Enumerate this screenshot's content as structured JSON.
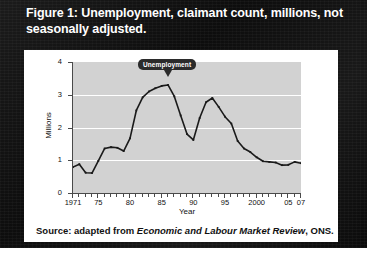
{
  "figure": {
    "title": "Figure 1: Unemployment, claimant count, millions, not seasonally adjusted.",
    "source_prefix": "Source: adapted from ",
    "source_italic": "Economic and Labour Market Review",
    "source_suffix": ", ONS."
  },
  "chart_data": {
    "type": "line",
    "title": "",
    "xlabel": "Year",
    "ylabel": "Millions",
    "annotation": "Unemployment",
    "xlim": [
      1971,
      2007
    ],
    "ylim": [
      0,
      4
    ],
    "yticks": [
      0,
      1,
      2,
      3,
      4
    ],
    "ytick_labels": [
      "0",
      "1",
      "2",
      "3",
      "4"
    ],
    "xtick_years": [
      1971,
      1972,
      1973,
      1974,
      1975,
      1976,
      1977,
      1978,
      1979,
      1980,
      1981,
      1982,
      1983,
      1984,
      1985,
      1986,
      1987,
      1988,
      1989,
      1990,
      1991,
      1992,
      1993,
      1994,
      1995,
      1996,
      1997,
      1998,
      1999,
      2000,
      2001,
      2002,
      2003,
      2004,
      2005,
      2006,
      2007
    ],
    "xtick_labels": [
      {
        "year": 1971,
        "label": "1971"
      },
      {
        "year": 1975,
        "label": "75"
      },
      {
        "year": 1980,
        "label": "80"
      },
      {
        "year": 1985,
        "label": "85"
      },
      {
        "year": 1990,
        "label": "90"
      },
      {
        "year": 1995,
        "label": "95"
      },
      {
        "year": 2000,
        "label": "2000"
      },
      {
        "year": 2005,
        "label": "05"
      },
      {
        "year": 2007,
        "label": "07"
      }
    ],
    "gridlines": [
      1,
      2,
      3
    ],
    "grid": true,
    "legend": "none",
    "series": [
      {
        "name": "Unemployment",
        "x": [
          1971,
          1972,
          1973,
          1974,
          1975,
          1976,
          1977,
          1978,
          1979,
          1980,
          1981,
          1982,
          1983,
          1984,
          1985,
          1986,
          1987,
          1988,
          1989,
          1990,
          1991,
          1992,
          1993,
          1994,
          1995,
          1996,
          1997,
          1998,
          1999,
          2000,
          2001,
          2002,
          2003,
          2004,
          2005,
          2006,
          2007
        ],
        "values": [
          0.79,
          0.88,
          0.62,
          0.61,
          0.98,
          1.36,
          1.4,
          1.38,
          1.28,
          1.67,
          2.52,
          2.92,
          3.1,
          3.2,
          3.27,
          3.3,
          2.95,
          2.37,
          1.8,
          1.62,
          2.29,
          2.77,
          2.9,
          2.63,
          2.33,
          2.12,
          1.59,
          1.36,
          1.25,
          1.09,
          0.97,
          0.95,
          0.93,
          0.85,
          0.86,
          0.95,
          0.91
        ]
      }
    ],
    "annotation_point": {
      "year": 1986,
      "value": 3.3
    }
  },
  "colors": {
    "frame": "#111111",
    "card": "#ffffff",
    "plot_background": "#d2d2d2",
    "gridline": "#ffffff",
    "series_line": "#1a1a1a",
    "callout_background": "#2b2b2b",
    "callout_text": "#ffffff",
    "axis": "#4a4a4a"
  }
}
